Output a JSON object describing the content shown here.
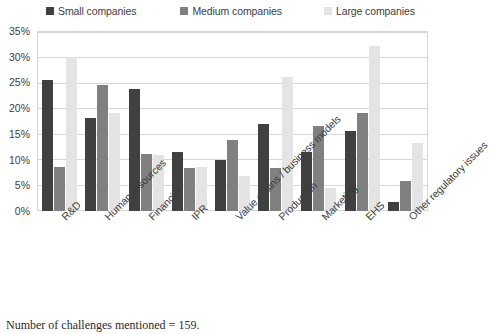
{
  "caption": "Number of challenges mentioned = 159.",
  "legend": {
    "items": [
      {
        "label": "Small companies",
        "color": "#404040",
        "icon": "legend-square-icon"
      },
      {
        "label": "Medium companies",
        "color": "#808080",
        "icon": "legend-square-icon"
      },
      {
        "label": "Large companies",
        "color": "#e4e4e4",
        "icon": "legend-square-icon"
      }
    ]
  },
  "axis": {
    "yticks": [
      "35%",
      "30%",
      "25%",
      "20%",
      "15%",
      "10%",
      "5%",
      "0%"
    ]
  },
  "chart_data": {
    "type": "bar",
    "title": "",
    "xlabel": "",
    "ylabel": "",
    "ylim": [
      0,
      35
    ],
    "ytick_step": 5,
    "grid": "horizontal",
    "legend_position": "top",
    "categories": [
      "R&D",
      "Human resources",
      "Financial",
      "IPR",
      "Value chains / business models",
      "Production",
      "Marketing",
      "EHS",
      "Other regulatory issues"
    ],
    "series": [
      {
        "name": "Small companies",
        "color": "#404040",
        "values": [
          25.5,
          18.0,
          23.8,
          11.5,
          9.9,
          17.0,
          11.5,
          15.5,
          1.7
        ]
      },
      {
        "name": "Medium companies",
        "color": "#808080",
        "values": [
          8.5,
          24.5,
          11.0,
          8.3,
          13.8,
          8.4,
          16.5,
          19.0,
          5.8
        ]
      },
      {
        "name": "Large companies",
        "color": "#e4e4e4",
        "values": [
          30.0,
          19.0,
          10.8,
          8.6,
          6.8,
          26.0,
          4.4,
          32.0,
          13.3
        ]
      }
    ]
  }
}
